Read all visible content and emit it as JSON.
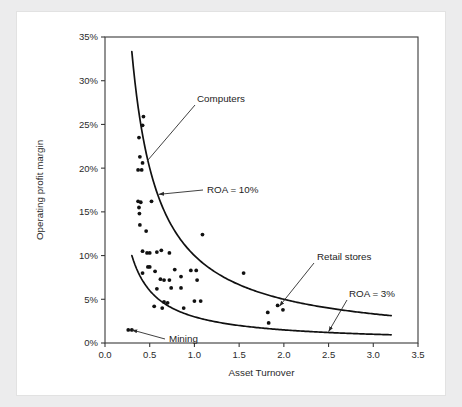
{
  "chart_data": {
    "type": "scatter",
    "title": "",
    "xlabel": "Asset Turnover",
    "ylabel": "Operating profit margin",
    "xlim": [
      0.0,
      3.5
    ],
    "ylim": [
      0,
      35
    ],
    "grid": false,
    "legend": "none",
    "xticks": [
      "0.0",
      "0.5",
      "1.0",
      "1.5",
      "2.0",
      "2.5",
      "3.0",
      "3.5"
    ],
    "xtick_values": [
      0.0,
      0.5,
      1.0,
      1.5,
      2.0,
      2.5,
      3.0,
      3.5
    ],
    "yticks": [
      "0%",
      "5%",
      "10%",
      "15%",
      "20%",
      "25%",
      "30%",
      "35%"
    ],
    "ytick_values": [
      0,
      5,
      10,
      15,
      20,
      25,
      30,
      35
    ],
    "points": [
      [
        0.26,
        1.5
      ],
      [
        0.3,
        1.5
      ],
      [
        0.37,
        19.8
      ],
      [
        0.41,
        19.8
      ],
      [
        0.39,
        21.3
      ],
      [
        0.42,
        20.6
      ],
      [
        0.38,
        23.5
      ],
      [
        0.42,
        24.9
      ],
      [
        0.43,
        25.9
      ],
      [
        0.37,
        16.2
      ],
      [
        0.4,
        16.1
      ],
      [
        0.52,
        16.2
      ],
      [
        0.38,
        15.5
      ],
      [
        0.385,
        14.8
      ],
      [
        0.39,
        13.5
      ],
      [
        0.46,
        12.8
      ],
      [
        0.42,
        10.5
      ],
      [
        0.47,
        10.3
      ],
      [
        0.5,
        10.3
      ],
      [
        0.58,
        10.4
      ],
      [
        0.63,
        10.6
      ],
      [
        0.72,
        10.3
      ],
      [
        0.42,
        8.0
      ],
      [
        0.48,
        8.7
      ],
      [
        0.5,
        8.7
      ],
      [
        0.56,
        8.2
      ],
      [
        0.62,
        7.3
      ],
      [
        0.66,
        7.2
      ],
      [
        0.72,
        7.2
      ],
      [
        0.78,
        8.4
      ],
      [
        0.85,
        7.6
      ],
      [
        0.96,
        8.3
      ],
      [
        1.02,
        8.3
      ],
      [
        1.03,
        7.2
      ],
      [
        0.58,
        6.2
      ],
      [
        0.74,
        6.3
      ],
      [
        0.85,
        6.3
      ],
      [
        0.55,
        4.2
      ],
      [
        0.64,
        4.0
      ],
      [
        0.66,
        4.7
      ],
      [
        0.7,
        4.6
      ],
      [
        0.88,
        4.0
      ],
      [
        1.0,
        4.8
      ],
      [
        1.07,
        4.8
      ],
      [
        1.09,
        12.4
      ],
      [
        1.55,
        8.0
      ],
      [
        1.82,
        3.5
      ],
      [
        1.83,
        2.3
      ],
      [
        1.93,
        4.3
      ],
      [
        1.99,
        3.8
      ]
    ],
    "curves": [
      {
        "name": "ROA = 10%",
        "equation": "margin = 10 / turnover",
        "roa": 10,
        "x_start": 0.3,
        "x_end": 3.2
      },
      {
        "name": "ROA = 3%",
        "equation": "margin = 3 / turnover",
        "roa": 3,
        "x_start": 0.3,
        "x_end": 3.2
      }
    ],
    "annotations": [
      {
        "label": "Computers",
        "target_x": 0.47,
        "target_y": 20.8
      },
      {
        "label": "ROA = 10%",
        "target_x": 0.6,
        "target_y": 17.0
      },
      {
        "label": "Retail stores",
        "target_x": 1.95,
        "target_y": 4.2
      },
      {
        "label": "ROA = 3%",
        "target_x": 2.5,
        "target_y": 1.3
      },
      {
        "label": "Mining",
        "target_x": 0.3,
        "target_y": 1.5
      }
    ]
  },
  "colors": {
    "page_background": "#ececed",
    "card_background": "#ffffff",
    "axis": "#3a3a3a",
    "curve": "#111111",
    "point": "#111111",
    "text": "#1d1d1d"
  }
}
